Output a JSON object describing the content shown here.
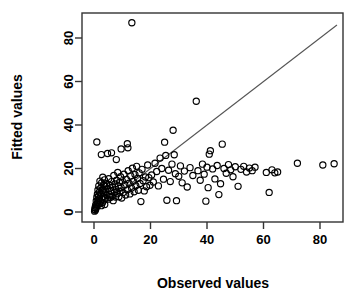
{
  "chart_data": {
    "type": "scatter",
    "title": "",
    "xlabel": "Observed values",
    "ylabel": "Fitted values",
    "xlim": [
      -3,
      88
    ],
    "ylim": [
      -3,
      90
    ],
    "xticks": [
      0,
      20,
      40,
      60,
      80
    ],
    "yticks": [
      0,
      20,
      40,
      60,
      80
    ],
    "xtick_labels": [
      "0",
      "20",
      "40",
      "60",
      "80"
    ],
    "ytick_labels": [
      "0",
      "20",
      "40",
      "60",
      "80"
    ],
    "grid": false,
    "legend": "none",
    "marker": "open-circle",
    "marker_color": "#000000",
    "reference_line": {
      "name": "identity-line",
      "type": "line",
      "slope": 1,
      "intercept": 0,
      "color": "#555555",
      "x_start": 0,
      "y_start": 0,
      "x_end": 86,
      "y_end": 86
    },
    "points": [
      [
        0.2,
        0.4
      ],
      [
        0.3,
        1.2
      ],
      [
        0.4,
        2.1
      ],
      [
        0.5,
        0.8
      ],
      [
        0.6,
        3.2
      ],
      [
        0.7,
        1.6
      ],
      [
        0.8,
        5.1
      ],
      [
        0.9,
        2.4
      ],
      [
        1.0,
        6.8
      ],
      [
        1.1,
        3.6
      ],
      [
        1.2,
        8.2
      ],
      [
        1.3,
        4.5
      ],
      [
        1.4,
        10.1
      ],
      [
        1.5,
        5.3
      ],
      [
        1.6,
        7.4
      ],
      [
        1.7,
        12.0
      ],
      [
        1.8,
        6.1
      ],
      [
        1.9,
        9.2
      ],
      [
        2.0,
        3.8
      ],
      [
        2.1,
        14.2
      ],
      [
        2.2,
        7.9
      ],
      [
        2.3,
        5.0
      ],
      [
        2.4,
        11.1
      ],
      [
        2.5,
        8.6
      ],
      [
        2.6,
        2.9
      ],
      [
        2.7,
        13.4
      ],
      [
        2.8,
        6.5
      ],
      [
        2.9,
        9.8
      ],
      [
        3.0,
        4.2
      ],
      [
        3.1,
        16.0
      ],
      [
        3.2,
        10.5
      ],
      [
        3.3,
        7.1
      ],
      [
        3.4,
        12.6
      ],
      [
        3.5,
        5.6
      ],
      [
        3.6,
        8.9
      ],
      [
        3.7,
        14.8
      ],
      [
        3.8,
        3.4
      ],
      [
        3.9,
        11.7
      ],
      [
        4.0,
        6.3
      ],
      [
        4.2,
        9.4
      ],
      [
        4.4,
        13.0
      ],
      [
        4.6,
        7.6
      ],
      [
        4.8,
        10.8
      ],
      [
        5.0,
        5.9
      ],
      [
        5.2,
        15.3
      ],
      [
        5.4,
        8.1
      ],
      [
        5.6,
        12.2
      ],
      [
        5.8,
        6.7
      ],
      [
        6.0,
        9.9
      ],
      [
        6.2,
        14.0
      ],
      [
        6.4,
        7.3
      ],
      [
        6.6,
        11.4
      ],
      [
        6.8,
        5.2
      ],
      [
        7.0,
        16.8
      ],
      [
        7.2,
        9.1
      ],
      [
        7.4,
        12.9
      ],
      [
        7.6,
        6.9
      ],
      [
        7.8,
        10.3
      ],
      [
        8.0,
        14.6
      ],
      [
        8.2,
        8.4
      ],
      [
        8.4,
        18.2
      ],
      [
        8.6,
        11.9
      ],
      [
        8.8,
        7.0
      ],
      [
        9.0,
        13.6
      ],
      [
        9.2,
        9.6
      ],
      [
        9.4,
        16.2
      ],
      [
        9.6,
        11.2
      ],
      [
        9.8,
        6.4
      ],
      [
        10.0,
        14.3
      ],
      [
        10.3,
        9.0
      ],
      [
        10.6,
        17.4
      ],
      [
        10.9,
        12.4
      ],
      [
        11.2,
        7.8
      ],
      [
        11.5,
        15.0
      ],
      [
        11.8,
        10.2
      ],
      [
        12.1,
        19.0
      ],
      [
        12.4,
        13.2
      ],
      [
        12.7,
        8.3
      ],
      [
        13.0,
        16.6
      ],
      [
        13.3,
        11.0
      ],
      [
        13.6,
        20.1
      ],
      [
        13.9,
        14.1
      ],
      [
        14.2,
        9.3
      ],
      [
        14.5,
        17.2
      ],
      [
        14.8,
        12.1
      ],
      [
        15.1,
        21.0
      ],
      [
        15.4,
        15.4
      ],
      [
        15.7,
        10.0
      ],
      [
        16.0,
        18.0
      ],
      [
        16.3,
        13.1
      ],
      [
        16.6,
        4.8
      ],
      [
        17.0,
        19.6
      ],
      [
        17.4,
        14.4
      ],
      [
        17.8,
        9.7
      ],
      [
        18.2,
        16.1
      ],
      [
        18.6,
        11.6
      ],
      [
        19.0,
        21.6
      ],
      [
        19.4,
        15.8
      ],
      [
        19.8,
        12.3
      ],
      [
        1.0,
        32.2
      ],
      [
        2.6,
        26.4
      ],
      [
        4.8,
        26.9
      ],
      [
        6.2,
        27.2
      ],
      [
        7.9,
        24.1
      ],
      [
        9.6,
        29.0
      ],
      [
        11.8,
        31.4
      ],
      [
        13.4,
        87.0
      ],
      [
        12.0,
        29.5
      ],
      [
        20.4,
        17.0
      ],
      [
        21.0,
        13.8
      ],
      [
        21.6,
        22.4
      ],
      [
        22.2,
        18.6
      ],
      [
        22.8,
        12.0
      ],
      [
        23.4,
        24.8
      ],
      [
        24.0,
        20.0
      ],
      [
        24.6,
        15.1
      ],
      [
        25.0,
        32.1
      ],
      [
        25.4,
        26.0
      ],
      [
        25.8,
        5.4
      ],
      [
        26.4,
        19.2
      ],
      [
        27.0,
        14.0
      ],
      [
        27.6,
        22.0
      ],
      [
        28.0,
        37.6
      ],
      [
        28.4,
        26.3
      ],
      [
        28.8,
        17.6
      ],
      [
        29.2,
        5.2
      ],
      [
        30.0,
        16.4
      ],
      [
        30.6,
        21.2
      ],
      [
        31.2,
        13.4
      ],
      [
        32.0,
        18.8
      ],
      [
        33.0,
        11.5
      ],
      [
        34.0,
        20.4
      ],
      [
        35.0,
        16.8
      ],
      [
        36.2,
        50.9
      ],
      [
        36.8,
        19.0
      ],
      [
        37.6,
        14.6
      ],
      [
        38.4,
        22.0
      ],
      [
        39.0,
        17.4
      ],
      [
        39.6,
        5.0
      ],
      [
        40.0,
        20.6
      ],
      [
        40.4,
        11.2
      ],
      [
        40.8,
        26.6
      ],
      [
        41.2,
        28.2
      ],
      [
        42.0,
        19.8
      ],
      [
        42.8,
        15.2
      ],
      [
        43.6,
        21.4
      ],
      [
        44.2,
        8.0
      ],
      [
        44.8,
        13.0
      ],
      [
        45.4,
        31.2
      ],
      [
        46.0,
        20.0
      ],
      [
        46.8,
        17.8
      ],
      [
        47.6,
        21.8
      ],
      [
        48.4,
        19.4
      ],
      [
        49.2,
        16.2
      ],
      [
        50.0,
        20.8
      ],
      [
        51.0,
        11.8
      ],
      [
        52.0,
        19.6
      ],
      [
        53.0,
        21.0
      ],
      [
        54.0,
        18.4
      ],
      [
        55.0,
        20.2
      ],
      [
        56.0,
        19.0
      ],
      [
        57.0,
        20.6
      ],
      [
        61.0,
        18.2
      ],
      [
        62.0,
        9.0
      ],
      [
        63.0,
        19.4
      ],
      [
        64.0,
        18.0
      ],
      [
        65.0,
        18.4
      ],
      [
        72.0,
        22.4
      ],
      [
        81.0,
        21.6
      ],
      [
        85.0,
        22.2
      ]
    ]
  }
}
